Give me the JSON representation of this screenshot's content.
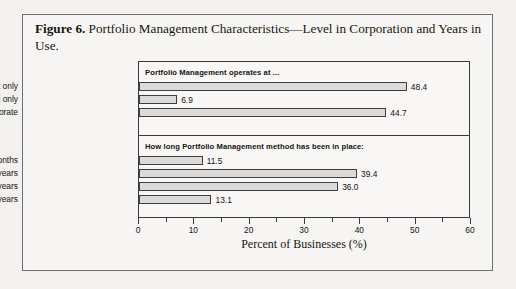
{
  "figure": {
    "label": "Figure 6.",
    "caption": " Portfolio Management Characteristics—Level in Corporation and Years in Use."
  },
  "chart_data": {
    "type": "bar",
    "orientation": "horizontal",
    "title": "Portfolio Management Characteristics—Level in Corporation and Years in Use.",
    "xlabel": "Percent of Businesses (%)",
    "ylabel": "",
    "xlim": [
      0,
      60
    ],
    "xticks": [
      0,
      10,
      20,
      30,
      40,
      50,
      60
    ],
    "xtick_labels": [
      "0",
      "10",
      "20",
      "30",
      "40",
      "50",
      "60"
    ],
    "minor_xticks": [
      5,
      15,
      25,
      35,
      45,
      55
    ],
    "grid": false,
    "legend": "none",
    "panels": [
      {
        "title": "Portfolio Management operates at ...",
        "categories": [
          "Business Unit only",
          "Corporate level only",
          "Both BU and Corporate"
        ],
        "values": [
          48.4,
          6.9,
          44.7
        ],
        "value_labels": [
          "48.4",
          "6.9",
          "44.7"
        ]
      },
      {
        "title": "How long Portfolio Management method has been in place:",
        "categories": [
          "less than 6 months",
          "6 months–2 years",
          "2–5 years",
          "more than 5 years"
        ],
        "values": [
          11.5,
          39.4,
          36.0,
          13.1
        ],
        "value_labels": [
          "11.5",
          "39.4",
          "36.0",
          "13.1"
        ]
      }
    ],
    "colors": {
      "bar_fill": "#dcdad8",
      "bar_border": "#3f3f3f",
      "axis": "#3a3a3a",
      "text": "#131313",
      "frame": "#6f6f6f",
      "background": "#f6f5f3"
    }
  }
}
